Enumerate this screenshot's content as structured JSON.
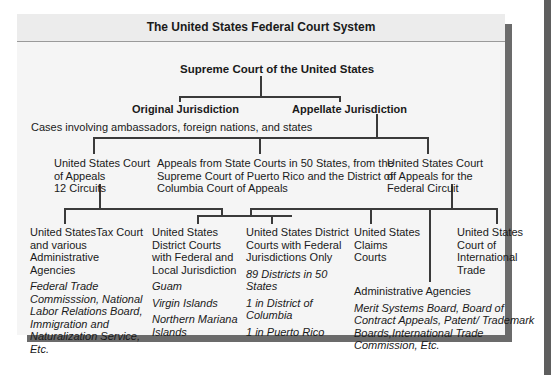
{
  "title": "The United States Federal Court System",
  "supreme_court": "Supreme Court of the United States",
  "original_jurisdiction": {
    "label": "Original Jurisdiction",
    "note": "Cases involving ambassadors, foreign nations, and states"
  },
  "appellate_jurisdiction": {
    "label": "Appellate Jurisdiction"
  },
  "appeals_level": {
    "circuit_court": [
      "United States Court",
      "of Appeals",
      "12 Circuits"
    ],
    "state_appeals": [
      "Appeals from State Courts in 50 States, from the",
      "Supreme Court of Puerto Rico and the District of",
      "Columbia Court of Appeals"
    ],
    "federal_circuit": [
      "United States Court",
      "of Appeals for the",
      "Federal Circuit"
    ]
  },
  "trial_level": {
    "tax_court": {
      "title": [
        "United StatesTax Court",
        "and various",
        "Administrative",
        "Agencies"
      ],
      "details": [
        "Federal Trade",
        "Commisssion, National",
        "Labor Relations Board,",
        "Immigration and",
        "Naturalization Service,",
        "Etc."
      ]
    },
    "district_federal_local": {
      "title": [
        "United States",
        "District Courts",
        "with Federal and",
        "Local Jurisdiction"
      ],
      "items": [
        "Guam",
        "Virgin Islands",
        [
          "Northern Mariana",
          "Islands"
        ]
      ]
    },
    "district_federal_only": {
      "title": [
        "United States District",
        "Courts with Federal",
        "Jurisdictions Only"
      ],
      "items": [
        [
          "89 Districts in 50",
          "States"
        ],
        [
          "1 in District of",
          "Columbia"
        ],
        "1 in Puerto Rico"
      ]
    },
    "claims_courts": {
      "title": [
        "United States",
        "Claims",
        "Courts"
      ]
    },
    "international_trade": {
      "title": [
        "United States",
        "Court of",
        "International",
        "Trade"
      ]
    },
    "administrative_agencies": {
      "title": "Administrative Agencies",
      "details": [
        "Merit Systems Board, Board of",
        "Contract Appeals, Patent/ Trademark",
        "Boards,International Trade",
        "Commission, Etc."
      ]
    }
  },
  "colors": {
    "panel": "#f5f5f5",
    "header": "#ececec",
    "lines": "#3a3a3a",
    "shadow": "#6b6b6b"
  }
}
